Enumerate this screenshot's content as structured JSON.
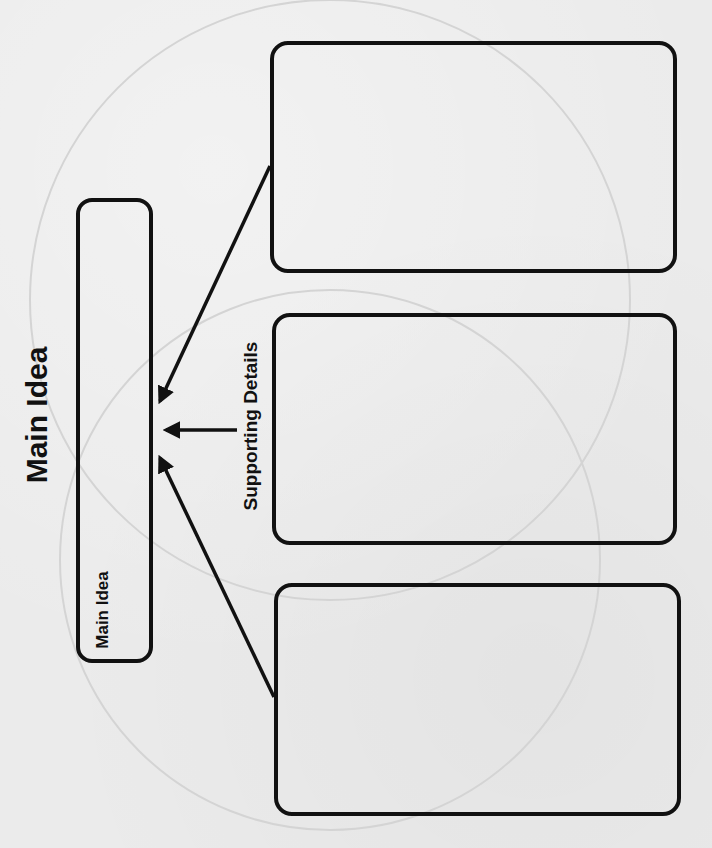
{
  "diagram": {
    "title": "Main Idea",
    "main_idea_box": {
      "label": "Main Idea"
    },
    "connector_label": "Supporting Details",
    "supporting_detail_boxes": [
      {
        "label": ""
      },
      {
        "label": ""
      },
      {
        "label": ""
      }
    ],
    "arrows": [
      {
        "from": "supporting-detail-box-1",
        "to": "main-idea-box"
      },
      {
        "from": "supporting-details-label",
        "to": "main-idea-box"
      },
      {
        "from": "supporting-detail-box-3",
        "to": "main-idea-box"
      }
    ],
    "colors": {
      "ink": "#111111",
      "paper": "#ebebeb",
      "watermark": "#d2d2d2"
    }
  }
}
